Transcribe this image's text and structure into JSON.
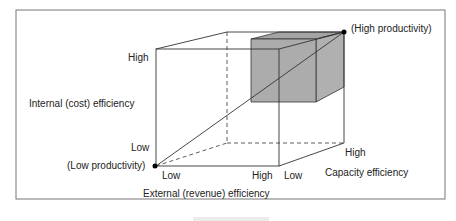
{
  "diagram": {
    "axes": {
      "vertical": {
        "label": "Internal (cost) efficiency",
        "high": "High",
        "low": "Low"
      },
      "horizontal": {
        "label": "External (revenue) efficiency",
        "low": "Low",
        "high": "High"
      },
      "depth": {
        "label": "Capacity efficiency",
        "low": "Low",
        "high": "High"
      }
    },
    "points": {
      "origin": "(Low productivity)",
      "far": "(High productivity)"
    },
    "colors": {
      "line": "#333333",
      "shaded_cube": "#aaaaaa",
      "frame": "#777777"
    }
  }
}
